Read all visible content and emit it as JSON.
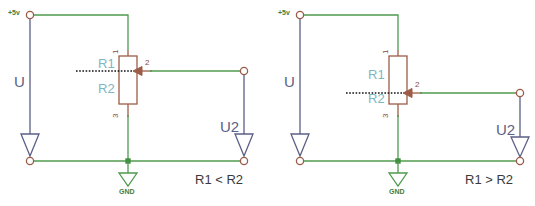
{
  "diagram": {
    "colors": {
      "wire_green": "#4f9a4f",
      "component_brown": "#9c5c48",
      "terminal_brown": "#9c5c48",
      "label_blue": "#7fb6c4",
      "voltage_blue": "#5b5f86",
      "dotted_black": "#111111",
      "text_dark": "#3a3a3a",
      "gnd_green": "#3f7d3f",
      "background": "#ffffff"
    },
    "circuits": [
      {
        "id": "left",
        "supply_label": "+5v",
        "input_voltage_label": "U",
        "output_voltage_label": "U2",
        "ground_label": "GND",
        "resistor_top_label": "R1",
        "resistor_bottom_label": "R2",
        "pin_labels": [
          "1",
          "2",
          "3"
        ],
        "comparison": "R1 < R2",
        "wiper_position": "near-top"
      },
      {
        "id": "right",
        "supply_label": "+5v",
        "input_voltage_label": "U",
        "output_voltage_label": "U2",
        "ground_label": "GND",
        "resistor_top_label": "R1",
        "resistor_bottom_label": "R2",
        "pin_labels": [
          "1",
          "2",
          "3"
        ],
        "comparison": "R1 > R2",
        "wiper_position": "near-bottom"
      }
    ]
  }
}
